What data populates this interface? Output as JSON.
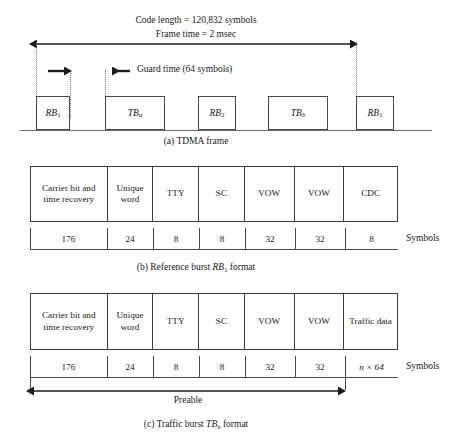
{
  "figure": {
    "panel_a": {
      "annotations": {
        "code_length": "Code length = 120,832 symbols",
        "frame_time": "Frame time = 2 msec",
        "guard_time": "Guard time (64 symbols)"
      },
      "bursts": [
        {
          "label": "RB",
          "sub": "1"
        },
        {
          "label": "TB",
          "sub": "a"
        },
        {
          "label": "RB",
          "sub": "2"
        },
        {
          "label": "TB",
          "sub": "b"
        },
        {
          "label": "RB",
          "sub": "1"
        }
      ],
      "caption": "(a) TDMA frame"
    },
    "panel_b": {
      "fields": [
        "Carrier bit and time recovery",
        "Unique word",
        "TTY",
        "SC",
        "VOW",
        "VOW",
        "CDC"
      ],
      "symbols": [
        "176",
        "24",
        "8",
        "8",
        "32",
        "32",
        "8"
      ],
      "symbols_unit": "Symbols",
      "caption_prefix": "(b) Reference burst ",
      "caption_italic": "RB",
      "caption_sub": "1",
      "caption_suffix": " format"
    },
    "panel_c": {
      "fields": [
        "Carrier bit and time recovery",
        "Unique word",
        "TTY",
        "SC",
        "VOW",
        "VOW",
        "Traffic data"
      ],
      "symbols": [
        "176",
        "24",
        "8",
        "8",
        "32",
        "32",
        "n × 64"
      ],
      "symbols_unit": "Symbols",
      "preamble_label": "Preable",
      "caption_prefix": "(c) Traffic burst ",
      "caption_italic": "TB",
      "caption_sub": "b",
      "caption_suffix": " format"
    }
  },
  "colors": {
    "line": "#3c3c3c",
    "baseline": "#6e6e6e",
    "dashed": "#7a7a7a",
    "text": "#1b1b1b",
    "background": "#ffffff"
  }
}
